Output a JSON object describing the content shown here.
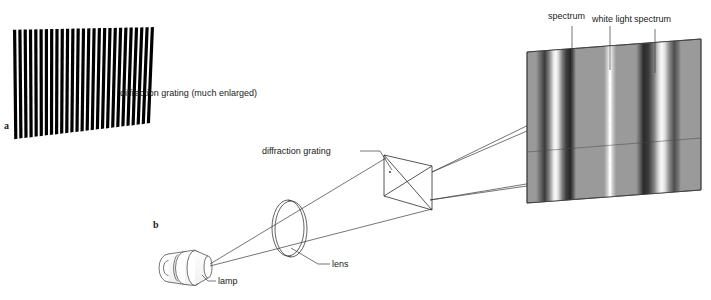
{
  "figure": {
    "background_color": "#ffffff",
    "stroke_color": "#3a3a3a",
    "text_color": "#1a1a1a"
  },
  "panels": [
    {
      "id": "a",
      "label": "a"
    },
    {
      "id": "b",
      "label": "b"
    }
  ],
  "labels": {
    "grating_enlarged": "diffraction grating (much enlarged)",
    "grating": "diffraction grating",
    "lamp": "lamp",
    "lens": "lens",
    "spectrum_left": "spectrum",
    "white_light": "white light",
    "spectrum_right": "spectrum"
  },
  "grating_enlarged": {
    "line_count": 27,
    "line_color": "#000000",
    "description": "Array of closely spaced vertical black slits drawn in perspective"
  },
  "screen": {
    "base_color": "#9a9a9a",
    "bands": [
      {
        "name": "spectrum_left",
        "type": "spectrum"
      },
      {
        "name": "white_light",
        "type": "white-line"
      },
      {
        "name": "spectrum_right",
        "type": "spectrum"
      }
    ]
  },
  "optics": {
    "lamp_color": "#ffffff",
    "lens_color": "#ffffff",
    "grating_color": "#ffffff"
  }
}
